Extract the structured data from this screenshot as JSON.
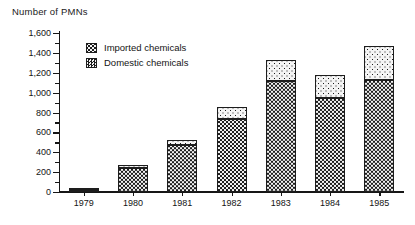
{
  "chart_data": {
    "type": "bar",
    "title": "Number of PMNs",
    "subtitle": "",
    "xlabel": "",
    "ylabel": "Number of PMNs",
    "categories": [
      "1979",
      "1980",
      "1981",
      "1982",
      "1983",
      "1984",
      "1985"
    ],
    "series": [
      {
        "name": "Domestic chemicals",
        "pattern": "dark-checkerboard",
        "values": [
          20,
          240,
          475,
          735,
          1115,
          945,
          1125
        ]
      },
      {
        "name": "Imported chemicals",
        "pattern": "light-dotted",
        "values": [
          10,
          30,
          50,
          120,
          210,
          230,
          345
        ]
      }
    ],
    "totals": [
      30,
      270,
      525,
      855,
      1325,
      1175,
      1470
    ],
    "stacked": true,
    "ylim": [
      0,
      1600
    ],
    "ytick_values": [
      0,
      200,
      400,
      600,
      800,
      1000,
      1200,
      1400,
      1600
    ],
    "ytick_labels": [
      "0",
      "200",
      "400",
      "600",
      "800",
      "1,000",
      "1,200",
      "1,400",
      "1,600"
    ],
    "yminor_step": 100,
    "grid": false,
    "legend_position": "top-left-inside"
  },
  "legend": {
    "items": [
      {
        "label": "Imported chemicals",
        "swatch": "imported"
      },
      {
        "label": "Domestic chemicals",
        "swatch": "domestic"
      }
    ]
  },
  "colors": {
    "axis": "#161616",
    "bar_outline": "#1d1d1d",
    "domestic_fill": "#1c1c1c",
    "imported_fill": "#f4f4f4",
    "background": "#ffffff"
  }
}
